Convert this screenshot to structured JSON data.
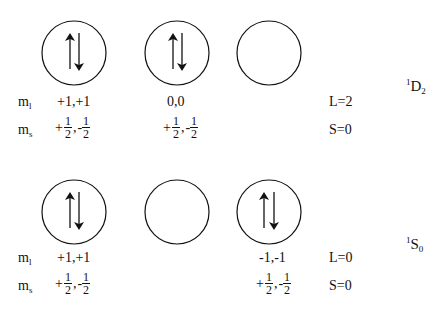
{
  "diagram": {
    "stroke_color": "#111111",
    "states": [
      {
        "term_symbol": {
          "multiplicity": "1",
          "letter": "D",
          "j": "2"
        },
        "orbitals": [
          {
            "cx": 74,
            "cy": 53,
            "occupancy": "paired"
          },
          {
            "cx": 177,
            "cy": 53,
            "occupancy": "paired"
          },
          {
            "cx": 269,
            "cy": 53,
            "occupancy": "empty"
          }
        ],
        "ml_label": {
          "main": "m",
          "sub": "l"
        },
        "ms_label": {
          "main": "m",
          "sub": "s"
        },
        "ml_values": [
          "+1,+1",
          "0,0"
        ],
        "ms_values": [
          {
            "sign1": "+",
            "num1": "1",
            "den1": "2",
            "sep": ",",
            "sign2": "-",
            "num2": "1",
            "den2": "2"
          },
          {
            "sign1": "+",
            "num1": "1",
            "den1": "2",
            "sep": ",",
            "sign2": "-",
            "num2": "1",
            "den2": "2"
          }
        ],
        "L": "L=2",
        "S": "S=0"
      },
      {
        "term_symbol": {
          "multiplicity": "1",
          "letter": "S",
          "j": "0"
        },
        "orbitals": [
          {
            "cx": 74,
            "cy": 212,
            "occupancy": "paired"
          },
          {
            "cx": 177,
            "cy": 212,
            "occupancy": "empty"
          },
          {
            "cx": 269,
            "cy": 212,
            "occupancy": "paired"
          }
        ],
        "ml_label": {
          "main": "m",
          "sub": "l"
        },
        "ms_label": {
          "main": "m",
          "sub": "s"
        },
        "ml_values": [
          "+1,+1",
          "-1,-1"
        ],
        "ms_values": [
          {
            "sign1": "+",
            "num1": "1",
            "den1": "2",
            "sep": ",",
            "sign2": "-",
            "num2": "1",
            "den2": "2"
          },
          {
            "sign1": "+",
            "num1": "1",
            "den1": "2",
            "sep": ",",
            "sign2": "-",
            "num2": "1",
            "den2": "2"
          }
        ],
        "L": "L=0",
        "S": "S=0"
      }
    ]
  }
}
